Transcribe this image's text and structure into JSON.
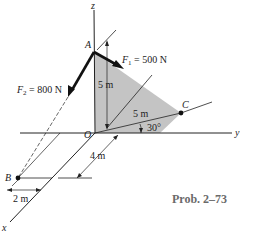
{
  "figure": {
    "caption": "Prob. 2–73",
    "axes": {
      "x": "x",
      "y": "y",
      "z": "z"
    },
    "points": {
      "A": "A",
      "B": "B",
      "C": "C",
      "O": "O"
    },
    "forces": {
      "F1": {
        "symbol": "F",
        "sub": "1",
        "value": " = 500 N"
      },
      "F2": {
        "symbol": "F",
        "sub": "2",
        "value": " = 800 N"
      }
    },
    "dimensions": {
      "AO_height": "5 m",
      "OC_length": "5 m",
      "angle": "30°",
      "x_offset": "4 m",
      "B_offset": "2 m"
    },
    "colors": {
      "plate": "#c4c4c4",
      "line": "#222222",
      "caption": "#6a6a6a"
    }
  }
}
